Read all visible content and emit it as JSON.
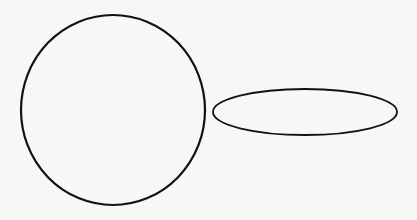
{
  "canvas": {
    "width": 417,
    "height": 220,
    "background": "#f7f7f5"
  },
  "shapes": [
    {
      "type": "circle",
      "cx": 113,
      "cy": 110,
      "rx": 92,
      "ry": 95,
      "stroke": "#111111",
      "stroke_width": 2.2
    },
    {
      "type": "ellipse",
      "cx": 305,
      "cy": 112,
      "rx": 92,
      "ry": 23,
      "stroke": "#111111",
      "stroke_width": 1.8
    }
  ]
}
